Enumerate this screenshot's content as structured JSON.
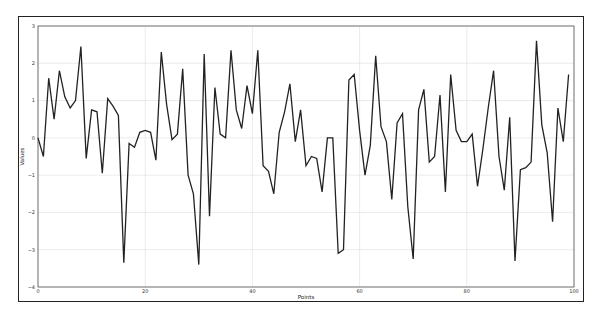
{
  "chart_data": {
    "type": "line",
    "title": "",
    "xlabel": "Points",
    "ylabel": "Values",
    "xlim": [
      0,
      100
    ],
    "ylim": [
      -4,
      3
    ],
    "xticks": [
      0,
      20,
      40,
      60,
      80,
      100
    ],
    "yticks": [
      -4,
      -3,
      -2,
      -1,
      0,
      1,
      2,
      3
    ],
    "grid": true,
    "legend": null,
    "series": [
      {
        "name": "values",
        "color": "#222222",
        "x": [
          0,
          1,
          2,
          3,
          4,
          5,
          6,
          7,
          8,
          9,
          10,
          11,
          12,
          13,
          14,
          15,
          16,
          17,
          18,
          19,
          20,
          21,
          22,
          23,
          24,
          25,
          26,
          27,
          28,
          29,
          30,
          31,
          32,
          33,
          34,
          35,
          36,
          37,
          38,
          39,
          40,
          41,
          42,
          43,
          44,
          45,
          46,
          47,
          48,
          49,
          50,
          51,
          52,
          53,
          54,
          55,
          56,
          57,
          58,
          59,
          60,
          61,
          62,
          63,
          64,
          65,
          66,
          67,
          68,
          69,
          70,
          71,
          72,
          73,
          74,
          75,
          76,
          77,
          78,
          79,
          80,
          81,
          82,
          83,
          84,
          85,
          86,
          87,
          88,
          89,
          90,
          91,
          92,
          93,
          94,
          95,
          96,
          97,
          98,
          99
        ],
        "values": [
          0.0,
          -0.5,
          1.6,
          0.5,
          1.8,
          1.1,
          0.8,
          1.0,
          2.45,
          -0.55,
          0.75,
          0.7,
          -0.95,
          1.05,
          0.85,
          0.6,
          -3.35,
          -0.15,
          -0.25,
          0.15,
          0.2,
          0.15,
          -0.6,
          2.3,
          0.9,
          -0.05,
          0.1,
          1.85,
          -1.0,
          -1.5,
          -3.4,
          2.25,
          -2.1,
          1.35,
          0.1,
          0.0,
          2.35,
          0.75,
          0.25,
          1.4,
          0.65,
          2.35,
          -0.75,
          -0.9,
          -1.5,
          0.15,
          0.7,
          1.45,
          -0.1,
          0.75,
          -0.75,
          -0.5,
          -0.55,
          -1.45,
          0.0,
          0.0,
          -3.1,
          -3.0,
          1.55,
          1.7,
          0.2,
          -1.0,
          -0.2,
          2.2,
          0.3,
          -0.1,
          -1.65,
          0.4,
          0.65,
          -1.85,
          -3.25,
          0.75,
          1.3,
          -0.65,
          -0.5,
          1.15,
          -1.45,
          1.7,
          0.2,
          -0.1,
          -0.1,
          0.1,
          -1.3,
          -0.3,
          0.8,
          1.8,
          -0.5,
          -1.4,
          0.55,
          -3.3,
          -0.85,
          -0.8,
          -0.65,
          2.6,
          0.35,
          -0.4,
          -2.25,
          0.8,
          -0.1,
          1.7
        ]
      }
    ]
  },
  "layout": {
    "plot": {
      "left": 38,
      "top": 26,
      "right": 574,
      "bottom": 287
    },
    "grid_color": "#dddddd",
    "line_color": "#222222"
  }
}
